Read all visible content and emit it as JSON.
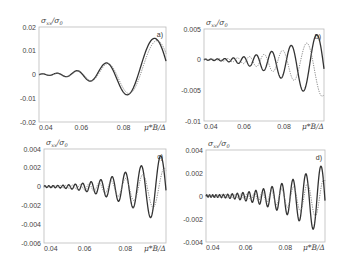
{
  "chart_data": [
    {
      "panel": "a)",
      "type": "line",
      "ylabel": "σ_xx/σ_0",
      "xlabel": "μ*B/Δ",
      "x_ticks": [
        "0.04",
        "0.06",
        "0.08"
      ],
      "y_ticks": [
        "0.02",
        "0.01",
        "0",
        "-0.01",
        "-0.02"
      ],
      "xlim": [
        0.04,
        0.1
      ],
      "ylim": [
        -0.02,
        0.02
      ],
      "frame": {
        "x0": 39,
        "x1": 166,
        "y0": 27,
        "y1": 122
      },
      "series": [
        {
          "name": "solid",
          "style": "solid",
          "amp": [
            0.0003,
            0.019
          ],
          "freq": 1.0,
          "phase": 0.0,
          "cycles": 4.5
        },
        {
          "name": "dotted",
          "style": "dotted",
          "amp": [
            0.0003,
            0.017
          ],
          "freq": 0.96,
          "phase": 0.0,
          "cycles": 4.5
        }
      ],
      "key_points_solid": [
        [
          0.04,
          0
        ],
        [
          0.055,
          0.001
        ],
        [
          0.058,
          -0.002
        ],
        [
          0.064,
          0.003
        ],
        [
          0.073,
          -0.007
        ],
        [
          0.088,
          0.0105
        ],
        [
          0.1,
          -0.017
        ]
      ]
    },
    {
      "panel": "b)",
      "type": "line",
      "ylabel": "σ_xx/σ_0",
      "xlabel": "μ*B/Δ",
      "x_ticks": [
        "0.04",
        "0.06",
        "0.08"
      ],
      "y_ticks": [
        "0.005",
        "0",
        "-0.005",
        "-0.01"
      ],
      "xlim": [
        0.04,
        0.1
      ],
      "ylim": [
        -0.01,
        0.005
      ],
      "frame": {
        "x0": 204,
        "x1": 324,
        "y0": 29,
        "y1": 121
      },
      "series": [
        {
          "name": "solid",
          "style": "solid",
          "amp": [
            0.0001,
            0.0062
          ],
          "cycles": 9.5,
          "offset": -0.0015
        },
        {
          "name": "dotted",
          "style": "dotted",
          "amp": [
            0.0001,
            0.005
          ],
          "cycles": 9.0,
          "offset": -0.0012
        }
      ],
      "key_points_solid": [
        [
          0.04,
          0
        ],
        [
          0.085,
          0.004
        ],
        [
          0.092,
          -0.0073
        ],
        [
          0.1,
          0.004
        ]
      ]
    },
    {
      "panel": "c)",
      "type": "line",
      "ylabel": "σ_xx/σ_0",
      "xlabel": "μ*B/Δ",
      "x_ticks": [
        "0.04",
        "0.06",
        "0.08"
      ],
      "y_ticks": [
        "0.004",
        "0.002",
        "0",
        "-0.002",
        "-0.004",
        "-0.006"
      ],
      "xlim": [
        0.04,
        0.1
      ],
      "ylim": [
        -0.006,
        0.004
      ],
      "frame": {
        "x0": 44,
        "x1": 166,
        "y0": 149,
        "y1": 243
      },
      "series": [
        {
          "name": "solid",
          "style": "solid",
          "amp": [
            0.0001,
            0.004
          ],
          "cycles": 13.5,
          "offset": -0.0004
        },
        {
          "name": "dotted",
          "style": "dotted",
          "amp": [
            0.0001,
            0.0024
          ],
          "cycles": 12.5,
          "offset": -0.0004
        }
      ],
      "key_points_solid": [
        [
          0.04,
          0
        ],
        [
          0.095,
          0.0035
        ],
        [
          0.09,
          -0.004
        ],
        [
          0.1,
          -0.0045
        ]
      ]
    },
    {
      "panel": "d)",
      "type": "line",
      "ylabel": "σ_xx/σ_0",
      "xlabel": "μ*B/Δ",
      "x_ticks": [
        "0.04",
        "0.06",
        "0.08"
      ],
      "y_ticks": [
        "0.004",
        "0.002",
        "0",
        "-0.002",
        "-0.004"
      ],
      "xlim": [
        0.04,
        0.1
      ],
      "ylim": [
        -0.004,
        0.004
      ],
      "frame": {
        "x0": 206,
        "x1": 325,
        "y0": 150,
        "y1": 242
      },
      "series": [
        {
          "name": "solid",
          "style": "solid",
          "amp": [
            0.0001,
            0.0032
          ],
          "cycles": 17.5,
          "offset": -0.0004
        },
        {
          "name": "dotted",
          "style": "dotted",
          "amp": [
            0.0001,
            0.0018
          ],
          "cycles": 16.5,
          "offset": -0.0003
        }
      ],
      "key_points_solid": [
        [
          0.04,
          0
        ],
        [
          0.094,
          0.0024
        ],
        [
          0.097,
          -0.004
        ],
        [
          0.1,
          0.002
        ]
      ]
    }
  ],
  "labels": {
    "ylabel": "σ_xx/σ_0",
    "ylabel_main": "σ",
    "ylabel_sub": "xx",
    "ylabel_den": "/σ",
    "ylabel_den_sub": "0",
    "xlabel": "μ*B/Δ"
  }
}
